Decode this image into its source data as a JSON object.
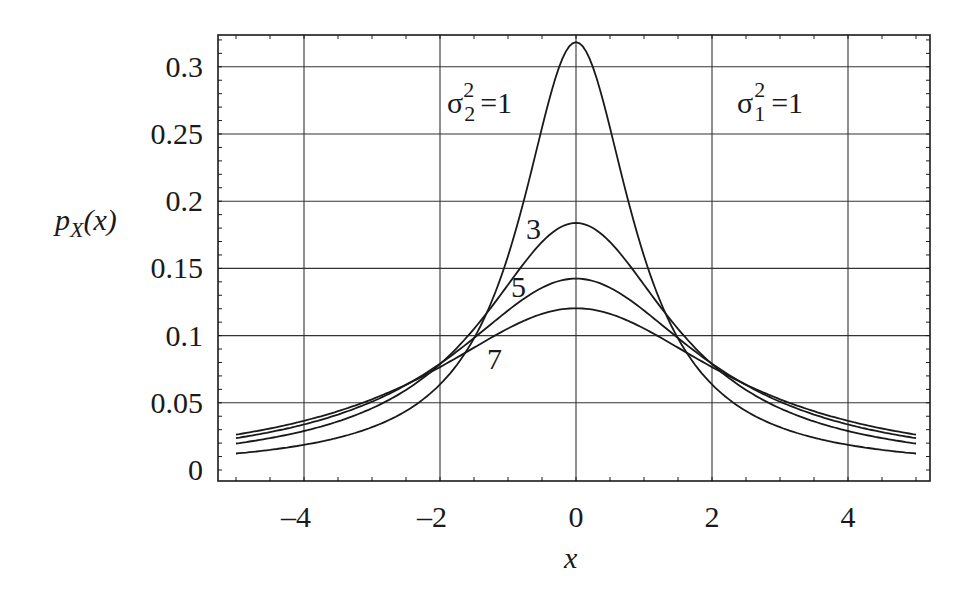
{
  "chart_data": {
    "type": "line",
    "title": "",
    "xlabel": "x",
    "ylabel": "p_X(x)",
    "xlim": [
      -5.25,
      5.22
    ],
    "ylim": [
      -0.008,
      0.325
    ],
    "x_ticks": [
      -4,
      -2,
      0,
      2,
      4
    ],
    "x_tick_labels": [
      "–4",
      "–2",
      "0",
      "2",
      "4"
    ],
    "y_ticks": [
      0,
      0.05,
      0.1,
      0.15,
      0.2,
      0.25,
      0.3
    ],
    "y_tick_labels": [
      "0",
      "0.05",
      "0.1",
      "0.15",
      "0.2",
      "0.25",
      "0.3"
    ],
    "grid": true,
    "legend": null,
    "annotations": [
      {
        "text": "σ₂² = 1",
        "x": -1.3,
        "y": 0.28
      },
      {
        "text": "σ₁² = 1",
        "x": 3.3,
        "y": 0.28
      },
      {
        "text": "3",
        "x": -0.6,
        "y": 0.185
      },
      {
        "text": "5",
        "x": -0.75,
        "y": 0.137
      },
      {
        "text": "7",
        "x": -0.9,
        "y": 0.092
      }
    ],
    "x": [
      -5,
      -4.5,
      -4,
      -3.5,
      -3,
      -2.5,
      -2,
      -1.5,
      -1,
      -0.75,
      -0.5,
      -0.25,
      0,
      0.25,
      0.5,
      0.75,
      1,
      1.5,
      2,
      2.5,
      3,
      3.5,
      4,
      4.5,
      5
    ],
    "series": [
      {
        "name": "σ₂² = 1",
        "values": [
          0.0122,
          0.015,
          0.0187,
          0.0245,
          0.0318,
          0.0439,
          0.0637,
          0.0979,
          0.1592,
          0.2037,
          0.2546,
          0.2996,
          0.3183,
          0.2996,
          0.2546,
          0.2037,
          0.1592,
          0.0979,
          0.0637,
          0.0439,
          0.0318,
          0.0245,
          0.0187,
          0.015,
          0.0122
        ]
      },
      {
        "name": "σ₂² = 3",
        "values": [
          0.0197,
          0.0237,
          0.029,
          0.0362,
          0.0459,
          0.0594,
          0.0788,
          0.105,
          0.1378,
          0.1548,
          0.1697,
          0.1804,
          0.1838,
          0.1804,
          0.1697,
          0.1548,
          0.1378,
          0.105,
          0.0788,
          0.0594,
          0.0459,
          0.0362,
          0.029,
          0.0237,
          0.0197
        ]
      },
      {
        "name": "σ₂² = 5",
        "values": [
          0.0237,
          0.0283,
          0.0339,
          0.0411,
          0.0503,
          0.0628,
          0.0787,
          0.098,
          0.1186,
          0.1283,
          0.1361,
          0.141,
          0.1424,
          0.141,
          0.1361,
          0.1283,
          0.1186,
          0.098,
          0.0787,
          0.0628,
          0.0503,
          0.0411,
          0.0339,
          0.0283,
          0.0237
        ]
      },
      {
        "name": "σ₂² = 7",
        "values": [
          0.0263,
          0.031,
          0.0368,
          0.044,
          0.0531,
          0.0641,
          0.078,
          0.0925,
          0.1053,
          0.1112,
          0.1159,
          0.1189,
          0.1203,
          0.1189,
          0.1159,
          0.1112,
          0.1053,
          0.0925,
          0.078,
          0.0641,
          0.0531,
          0.044,
          0.0368,
          0.031,
          0.0263
        ]
      }
    ]
  },
  "labels": {
    "ylabel_main": "p",
    "ylabel_sub": "X",
    "ylabel_arg": "(x)",
    "xlabel": "x",
    "sigma": "σ",
    "anno_left_sub": "2",
    "anno_left_sup": "2",
    "anno_left_eq": "=1",
    "anno_right_sub": "1",
    "anno_right_sup": "2",
    "anno_right_eq": "=1",
    "curve3": "3",
    "curve5": "5",
    "curve7": "7"
  },
  "colors": {
    "line": "#1a1a1a",
    "grid": "#333333",
    "background": "#ffffff"
  }
}
